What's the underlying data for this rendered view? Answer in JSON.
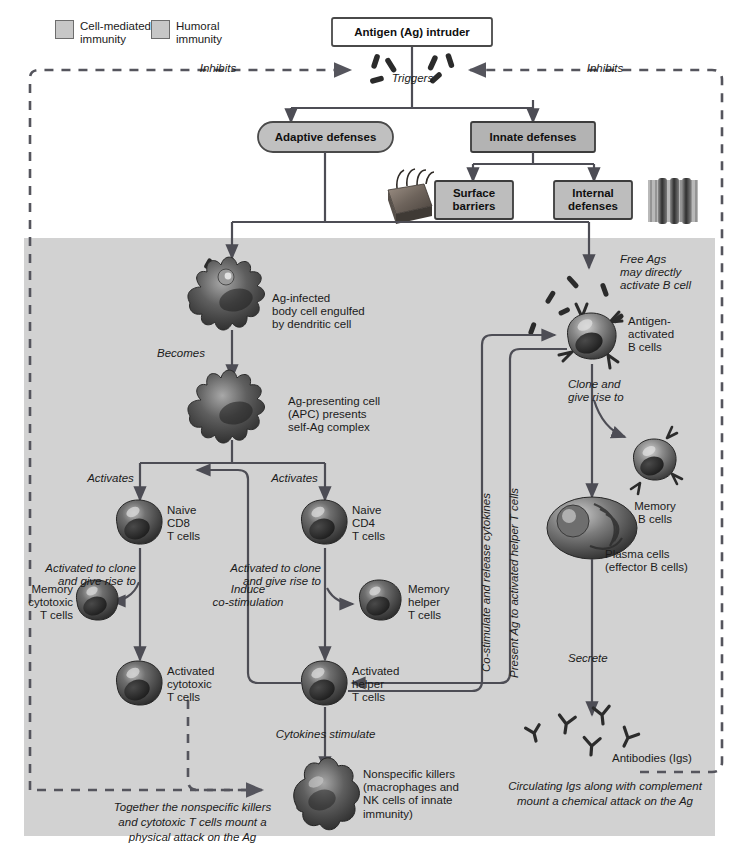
{
  "figure": {
    "type": "diagram"
  },
  "legend": {
    "items": [
      {
        "label_line1": "Cell-mediated",
        "label_line2": "immunity",
        "swatch_color": "#c7c7c7"
      },
      {
        "label_line1": "Humoral",
        "label_line2": "immunity",
        "swatch_color": "#c7c7c7"
      }
    ]
  },
  "boxes": {
    "antigen": "Antigen (Ag) intruder",
    "adaptive": "Adaptive defenses",
    "innate": "Innate defenses",
    "surface_barriers": "Surface\nbarriers",
    "internal_defenses": "Internal\ndefenses"
  },
  "edge_labels": {
    "inhibits_left": "Inhibits",
    "inhibits_right": "Inhibits",
    "triggers": "Triggers",
    "becomes": "Becomes",
    "activates_left": "Activates",
    "activates_right": "Activates",
    "activated_clone_left": "Activated to clone\nand give rise to",
    "activated_clone_right": "Activated to clone\nand give rise to",
    "induce_costim": "Induce\nco-stimulation",
    "cytokines_stimulate": "Cytokines stimulate",
    "clone_give_rise": "Clone and\ngive rise to",
    "secrete": "Secrete",
    "costimulate_release": "Co-stimulate and release cytokines",
    "present_ag": "Present Ag to activated helper T cells"
  },
  "cells": {
    "ag_infected": "Ag-infected\nbody cell engulfed\nby dendritic cell",
    "apc": "Ag-presenting cell\n(APC) presents\nself-Ag complex",
    "naive_cd8": "Naive\nCD8\nT cells",
    "naive_cd4": "Naive\nCD4\nT cells",
    "memory_cytotoxic": "Memory\ncytotoxic\nT cells",
    "memory_helper": "Memory\nhelper\nT cells",
    "activated_cytotoxic": "Activated\ncytotoxic\nT cells",
    "activated_helper": "Activated\nhelper\nT cells",
    "nonspecific_killers": "Nonspecific killers\n(macrophages and\nNK cells of innate\nimmunity)",
    "free_ags": "Free Ags\nmay directly\nactivate B cell",
    "antigen_activated_b": "Antigen-\nactivated\nB cells",
    "memory_b": "Memory\nB cells",
    "plasma_cells": "Plasma cells\n(effector B cells)",
    "antibodies": "Antibodies (Igs)"
  },
  "captions": {
    "left": "Together the nonspecific killers\nand cytotoxic T cells mount a\nphysical attack on the Ag",
    "right": "Circulating Igs along with complement\nmount a chemical attack on the Ag"
  },
  "colors": {
    "shaded_panel": "#d2d2d2",
    "box_fill": "#c0c0c0",
    "box_border": "#4a4a4a",
    "stroke": "#4d4d55",
    "cell_dark": "#3c3c3c",
    "cell_mid": "#707070",
    "page_bg": "#ffffff"
  }
}
